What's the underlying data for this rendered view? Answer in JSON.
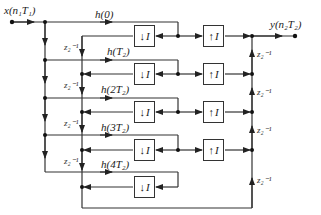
{
  "diagram": {
    "type": "polyphase interpolation/decimation filter block diagram",
    "input_label": "x(n₁T₁)",
    "output_label": "y(n₂T₂)",
    "coefficients": [
      "h(0)",
      "h(T₂)",
      "h(2T₂)",
      "h(3T₂)",
      "h(4T₂)"
    ],
    "left_delay_label": "z₂⁻¹",
    "right_delay_label": "z₂⁻¹",
    "down_sampler": {
      "arrow": "↓",
      "factor": "I"
    },
    "up_sampler": {
      "arrow": "↑",
      "factor": "I"
    },
    "left_delays_count": 4,
    "right_delays_count": 4,
    "down_sampler_count": 5,
    "up_sampler_count": 4
  }
}
